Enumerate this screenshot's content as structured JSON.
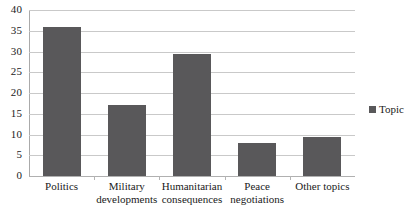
{
  "chart_data": {
    "type": "bar",
    "title": "",
    "xlabel": "",
    "ylabel": "",
    "categories": [
      "Politics",
      "Military developments",
      "Humanitarian consequences",
      "Peace negotiations",
      "Other topics"
    ],
    "category_lines": [
      [
        "Politics"
      ],
      [
        "Military",
        "developments"
      ],
      [
        "Humanitarian",
        "consequences"
      ],
      [
        "Peace",
        "negotiations"
      ],
      [
        "Other topics"
      ]
    ],
    "values": [
      36,
      17,
      29.5,
      8,
      9.5
    ],
    "series": [
      {
        "name": "Topic",
        "values": [
          36,
          17,
          29.5,
          8,
          9.5
        ]
      }
    ],
    "ylim": [
      0,
      40
    ],
    "ytick_step": 5,
    "ytick_labels": [
      "40",
      "35",
      "30",
      "25",
      "20",
      "15",
      "10",
      "5",
      "0"
    ],
    "ytick_values": [
      40,
      35,
      30,
      25,
      20,
      15,
      10,
      5,
      0
    ],
    "grid": "horizontal",
    "legend_position": "right",
    "bar_color": "#59585A",
    "gridline_color": "#C9C9C9",
    "axis_color": "#AAAAAA",
    "background_color": "#FFFFFF"
  },
  "legend": {
    "entries": [
      {
        "label": "Topic",
        "color": "#59585A"
      }
    ]
  }
}
